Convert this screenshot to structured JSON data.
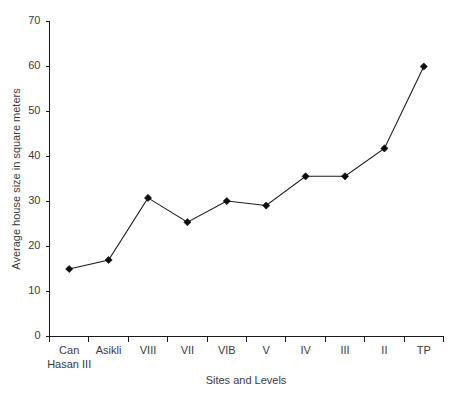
{
  "chart_data": {
    "type": "line",
    "title": "",
    "xlabel": "Sites and Levels",
    "ylabel": "Average house size in square meters",
    "categories": [
      "Can Hasan III",
      "Asikli",
      "VIII",
      "VII",
      "VIB",
      "V",
      "IV",
      "III",
      "II",
      "TP"
    ],
    "category_labels_wrapped": [
      [
        "Can",
        "Hasan III"
      ],
      [
        "Asikli"
      ],
      [
        "VIII"
      ],
      [
        "VII"
      ],
      [
        "VIB"
      ],
      [
        "V"
      ],
      [
        "IV"
      ],
      [
        "III"
      ],
      [
        "II"
      ],
      [
        "TP"
      ]
    ],
    "values": [
      15,
      17,
      30.8,
      25.4,
      30.1,
      29.1,
      35.6,
      35.6,
      41.8,
      60
    ],
    "ylim": [
      0,
      70
    ],
    "yticks": [
      0,
      10,
      20,
      30,
      40,
      50,
      60,
      70
    ],
    "ytick_labels": [
      "0",
      "10",
      "20",
      "30",
      "40",
      "50",
      "60",
      "70"
    ],
    "grid": false,
    "legend": "none",
    "marker": "diamond",
    "line_color": "#1a1a1a",
    "marker_color": "#0d0d0d",
    "background_color": "#ffffff"
  }
}
